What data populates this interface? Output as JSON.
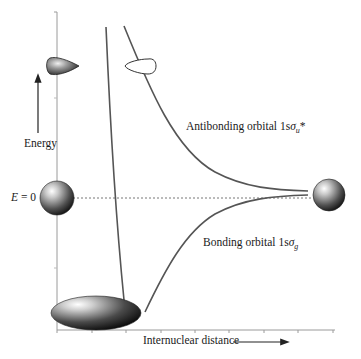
{
  "diagram": {
    "type": "energy-level-diagram",
    "y_axis": {
      "label": "Energy",
      "arrow": "up"
    },
    "x_axis": {
      "label": "Internuclear distance",
      "arrow": "right",
      "tick_count": 9
    },
    "reference_line": {
      "label_italic": "E",
      "label_rest": " = 0",
      "style": "dotted"
    },
    "curves": [
      {
        "id": "antibonding",
        "label_prefix": "Antibonding orbital 1s",
        "symbol": "σ",
        "subscript": "u",
        "suffix": "*"
      },
      {
        "id": "bonding",
        "label_prefix": "Bonding orbital 1s",
        "symbol": "σ",
        "subscript": "g",
        "suffix": ""
      }
    ],
    "orbital_shapes": [
      {
        "name": "antibonding-small-lobe-shaded",
        "position": "top-left on y-axis"
      },
      {
        "name": "antibonding-small-lobe-outline",
        "position": "top on antibonding curve"
      },
      {
        "name": "separated-atom-left",
        "position": "E=0 on y-axis"
      },
      {
        "name": "separated-atom-right",
        "position": "E=0 at large distance"
      },
      {
        "name": "bonding-ellipsoid",
        "position": "energy minimum"
      }
    ],
    "colors": {
      "curve": "#555555",
      "axis": "#999999",
      "dotted": "#777777",
      "text": "#1a1a1a"
    }
  }
}
